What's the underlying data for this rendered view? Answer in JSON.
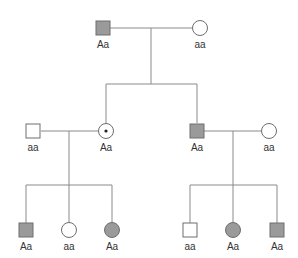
{
  "colors": {
    "affected_fill": "#9a9a9a",
    "unaffected_fill": "#ffffff",
    "stroke": "#6e6e6e",
    "line": "#8a8a8a"
  },
  "legend_semantics": {
    "shaded": "affected",
    "open": "unaffected",
    "dot": "carrier"
  },
  "generations": [
    {
      "id": "I",
      "individuals": [
        {
          "id": "I-1",
          "sex": "male",
          "status": "affected",
          "genotype": "Aa"
        },
        {
          "id": "I-2",
          "sex": "female",
          "status": "unaffected",
          "genotype": "aa"
        }
      ]
    },
    {
      "id": "II",
      "individuals": [
        {
          "id": "II-1",
          "sex": "male",
          "status": "unaffected",
          "genotype": "aa"
        },
        {
          "id": "II-2",
          "sex": "female",
          "status": "carrier",
          "genotype": "Aa"
        },
        {
          "id": "II-3",
          "sex": "male",
          "status": "affected",
          "genotype": "Aa"
        },
        {
          "id": "II-4",
          "sex": "female",
          "status": "unaffected",
          "genotype": "aa"
        }
      ]
    },
    {
      "id": "III",
      "individuals": [
        {
          "id": "III-1",
          "sex": "male",
          "status": "affected",
          "genotype": "Aa"
        },
        {
          "id": "III-2",
          "sex": "female",
          "status": "unaffected",
          "genotype": "aa"
        },
        {
          "id": "III-3",
          "sex": "female",
          "status": "affected",
          "genotype": "Aa"
        },
        {
          "id": "III-4",
          "sex": "male",
          "status": "unaffected",
          "genotype": "aa"
        },
        {
          "id": "III-5",
          "sex": "female",
          "status": "affected",
          "genotype": "Aa"
        },
        {
          "id": "III-6",
          "sex": "male",
          "status": "affected",
          "genotype": "Aa"
        }
      ]
    }
  ],
  "matings": [
    {
      "partners": [
        "I-1",
        "I-2"
      ],
      "children": [
        "II-2",
        "II-3"
      ]
    },
    {
      "partners": [
        "II-1",
        "II-2"
      ],
      "children": [
        "III-1",
        "III-2",
        "III-3"
      ]
    },
    {
      "partners": [
        "II-3",
        "II-4"
      ],
      "children": [
        "III-4",
        "III-5",
        "III-6"
      ]
    }
  ]
}
